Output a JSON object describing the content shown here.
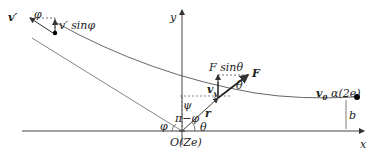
{
  "diagram": {
    "labels": {
      "v_prime": "v′",
      "phi_top": "φ",
      "v_prime_sin": "v′ sinφ",
      "y_axis": "y",
      "x_axis": "x",
      "F_sin": "F sinθ",
      "F": "F",
      "theta_F": "θ",
      "v_y": "v",
      "v_y_sub": "y",
      "psi": "ψ",
      "pi_minus_phi": "π−φ",
      "r": "r",
      "phi_bottom": "φ",
      "theta_bottom": "θ",
      "origin": "O(Ze)",
      "v0": "v",
      "v0_sub": "0",
      "alpha": "α(2e)",
      "b": "b"
    },
    "colors": {
      "line": "#555555",
      "axis": "#333333",
      "text": "#222222"
    }
  }
}
